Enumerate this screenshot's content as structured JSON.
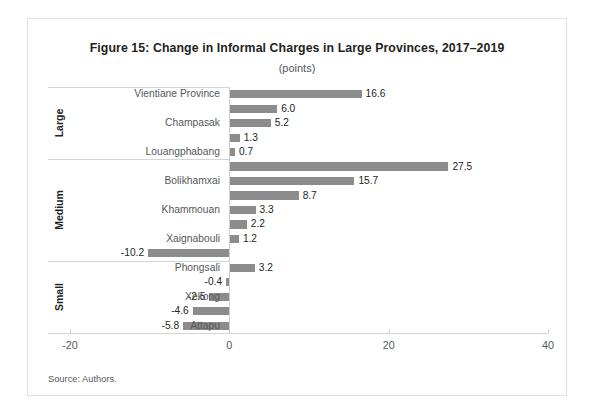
{
  "figure": {
    "title": "Figure 15: Change in Informal Charges in Large Provinces, 2017–2019",
    "subtitle": "(points)",
    "source": "Source: Authors."
  },
  "colors": {
    "bar": "#8c8c8c",
    "text": "#231f20",
    "muted": "#54585a",
    "rule": "#d5d5d5"
  },
  "groups": [
    {
      "label": "Large"
    },
    {
      "label": "Medium"
    },
    {
      "label": "Small"
    }
  ],
  "chart_data": {
    "type": "bar",
    "orientation": "horizontal",
    "title": "Figure 15: Change in Informal Charges in Large Provinces, 2017–2019",
    "subtitle": "(points)",
    "xlabel": "",
    "ylabel": "",
    "xlim": [
      -20,
      40
    ],
    "xticks": [
      -20,
      0,
      20,
      40
    ],
    "xticklabels": [
      "-20",
      "0",
      "20",
      "40"
    ],
    "grid": false,
    "legend": null,
    "bars": [
      {
        "label": "Vientiane Province",
        "value": 16.6,
        "value_label": "16.6",
        "group": "Large",
        "label_shown": true
      },
      {
        "label": "",
        "value": 6.0,
        "value_label": "6.0",
        "group": "Large",
        "label_shown": false
      },
      {
        "label": "Champasak",
        "value": 5.2,
        "value_label": "5.2",
        "group": "Large",
        "label_shown": true
      },
      {
        "label": "",
        "value": 1.3,
        "value_label": "1.3",
        "group": "Large",
        "label_shown": false
      },
      {
        "label": "Louangphabang",
        "value": 0.7,
        "value_label": "0.7",
        "group": "Large",
        "label_shown": true
      },
      {
        "label": "",
        "value": 27.5,
        "value_label": "27.5",
        "group": "Medium",
        "label_shown": false
      },
      {
        "label": "Bolikhamxai",
        "value": 15.7,
        "value_label": "15.7",
        "group": "Medium",
        "label_shown": true
      },
      {
        "label": "",
        "value": 8.7,
        "value_label": "8.7",
        "group": "Medium",
        "label_shown": false
      },
      {
        "label": "Khammouan",
        "value": 3.3,
        "value_label": "3.3",
        "group": "Medium",
        "label_shown": true
      },
      {
        "label": "",
        "value": 2.2,
        "value_label": "2.2",
        "group": "Medium",
        "label_shown": false
      },
      {
        "label": "Xaignabouli",
        "value": 1.2,
        "value_label": "1.2",
        "group": "Medium",
        "label_shown": true
      },
      {
        "label": "",
        "value": -10.2,
        "value_label": "-10.2",
        "group": "Medium",
        "label_shown": false
      },
      {
        "label": "Phongsali",
        "value": 3.2,
        "value_label": "3.2",
        "group": "Small",
        "label_shown": true
      },
      {
        "label": "",
        "value": -0.4,
        "value_label": "-0.4",
        "group": "Small",
        "label_shown": false
      },
      {
        "label": "Xekong",
        "value": -2.5,
        "value_label": "-2.5",
        "group": "Small",
        "label_shown": true
      },
      {
        "label": "",
        "value": -4.6,
        "value_label": "-4.6",
        "group": "Small",
        "label_shown": false
      },
      {
        "label": "Attapu",
        "value": -5.8,
        "value_label": "-5.8",
        "group": "Small",
        "label_shown": true
      }
    ],
    "group_boundaries_after_bar_index": [
      4,
      11
    ]
  }
}
